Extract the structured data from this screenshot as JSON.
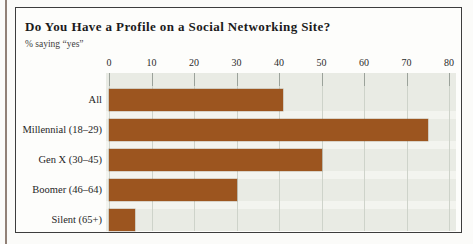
{
  "page": {
    "background": "#fbfbf9",
    "margin_rule_color": "#6e584b",
    "frame_border_color": "#3d3d3d"
  },
  "chart_data": {
    "type": "bar",
    "orientation": "horizontal",
    "title": "Do You Have a Profile on a Social Networking Site?",
    "subtitle": "% saying “yes”",
    "categories": [
      "All",
      "Millennial (18–29)",
      "Gen X (30–45)",
      "Boomer (46–64)",
      "Silent (65+)"
    ],
    "values": [
      41,
      75,
      50,
      30,
      6
    ],
    "xlabel": "",
    "ylabel": "",
    "xlim": [
      0,
      80
    ],
    "xticks": [
      0,
      10,
      20,
      30,
      40,
      50,
      60,
      70,
      80
    ],
    "grid": true,
    "legend": "none",
    "bar_color": "#9c551f",
    "plot_bg": "#e9ebe4",
    "gridline_color": "#ced3ca",
    "tick_color": "#9ba29a"
  }
}
